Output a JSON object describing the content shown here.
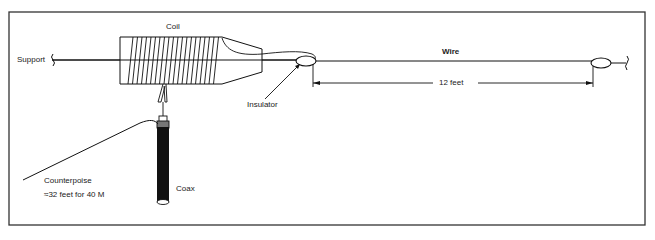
{
  "diagram": {
    "labels": {
      "coil": "Coil",
      "support": "Support",
      "wire": "Wire",
      "insulator": "Insulator",
      "length": "12 feet",
      "counterpoise": "Counterpoise",
      "counterpoise_length": "≈32 feet  for  40 M",
      "coax": "Coax"
    },
    "colors": {
      "line": "#111111",
      "frame": "#333333",
      "coax": "#111111"
    }
  }
}
